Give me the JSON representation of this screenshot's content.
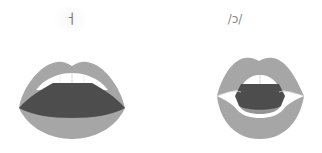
{
  "diagrams": [
    {
      "label": "ㅓ",
      "description": "open mouth, wide horizontal lips",
      "colors": {
        "lip": "#a6a6a6",
        "mouth": "#4d4d4d",
        "teeth": "#ffffff",
        "tooth_line": "#bdbdbd"
      }
    },
    {
      "label": "/ɔ/",
      "description": "rounded mouth, lips pushed forward",
      "colors": {
        "lip": "#a6a6a6",
        "mouth": "#4d4d4d",
        "teeth": "#ffffff",
        "tooth_line": "#bdbdbd"
      }
    }
  ]
}
